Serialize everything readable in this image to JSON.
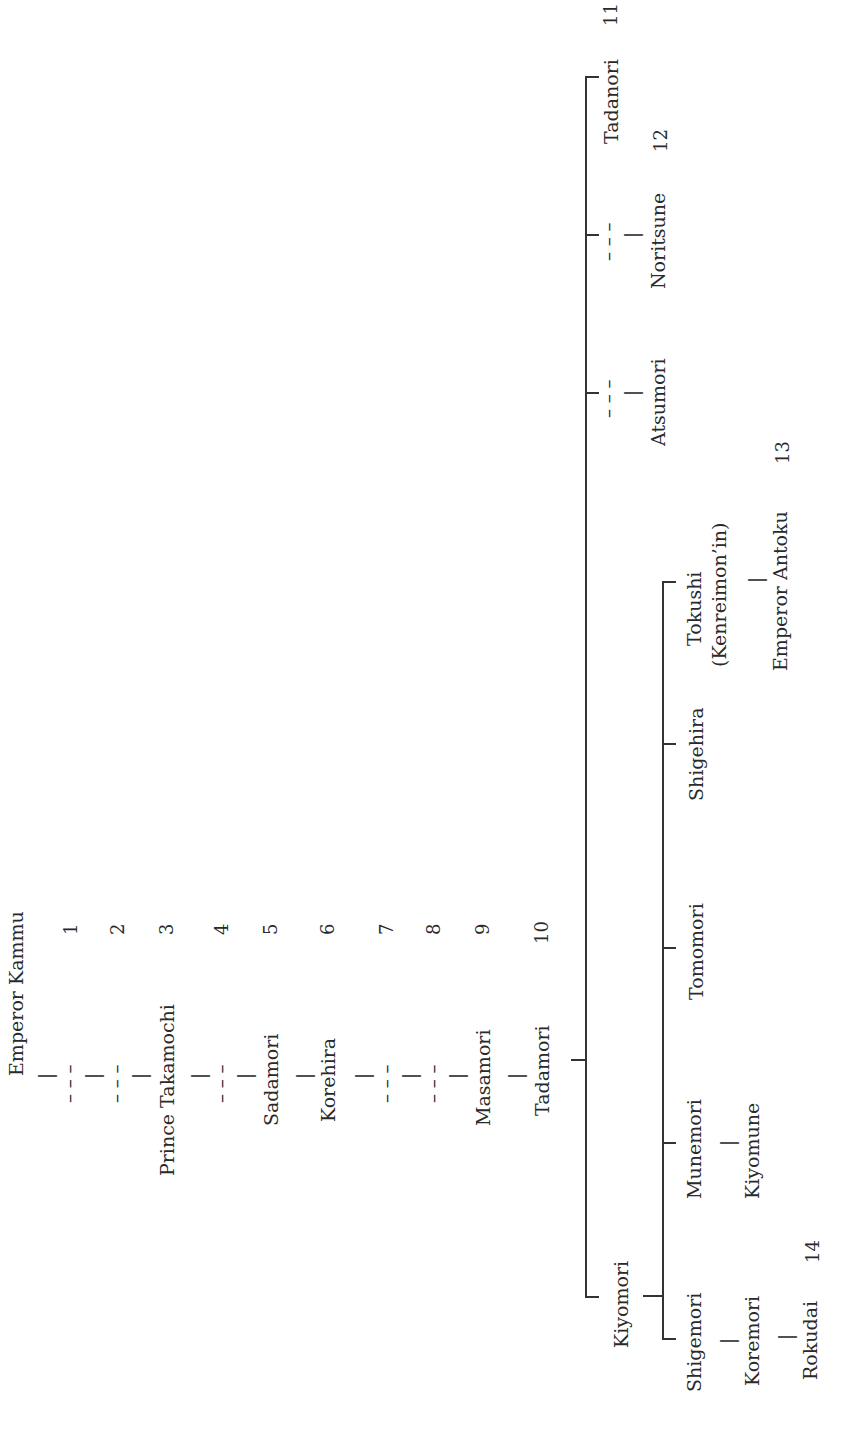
{
  "diagram": {
    "type": "genealogy",
    "orientation": "rotated-90-ccw",
    "line_color": "#333333",
    "text_color": "#2a2a2a",
    "ancestors": [
      {
        "name": "Emperor Kammu",
        "number": ""
      },
      {
        "name": "– – –",
        "number": "1"
      },
      {
        "name": "– – –",
        "number": "2"
      },
      {
        "name": "Prince Takamochi",
        "number": "3"
      },
      {
        "name": "– – –",
        "number": "4"
      },
      {
        "name": "Sadamori",
        "number": "5"
      },
      {
        "name": "Korehira",
        "number": "6"
      },
      {
        "name": "– – –",
        "number": "7"
      },
      {
        "name": "– – –",
        "number": "8"
      },
      {
        "name": "Masamori",
        "number": "9"
      },
      {
        "name": "Tadamori",
        "number": "10"
      }
    ],
    "tadamori_children": [
      {
        "name": "Kiyomori",
        "number": ""
      },
      {
        "name": "– – –",
        "child": "Atsumori",
        "number": ""
      },
      {
        "name": "– – –",
        "child": "Noritsune",
        "number": "12"
      },
      {
        "name": "Tadanori",
        "number": "11"
      }
    ],
    "kiyomori_children": [
      {
        "name": "Shigemori",
        "descendants": [
          "Koremori",
          "Rokudai"
        ],
        "number": "14"
      },
      {
        "name": "Munemori",
        "descendants": [
          "Kiyomune"
        ]
      },
      {
        "name": "Tomomori"
      },
      {
        "name": "Shigehira"
      },
      {
        "name": "Tokushi",
        "subtitle": "(Kenreimon’in)",
        "descendants": [
          "Emperor Antoku"
        ],
        "number": "13"
      }
    ],
    "connector_tick": "|",
    "dashed_gap": "– – –"
  },
  "labels": {
    "kammu": "Emperor Kammu",
    "takamochi": "Prince Takamochi",
    "sadamori": "Sadamori",
    "korehira": "Korehira",
    "masamori": "Masamori",
    "tadamori": "Tadamori",
    "kiyomori": "Kiyomori",
    "atsumori": "Atsumori",
    "noritsune": "Noritsune",
    "tadanori": "Tadanori",
    "shigemori": "Shigemori",
    "koremori": "Koremori",
    "rokudai": "Rokudai",
    "munemori": "Munemori",
    "kiyomune": "Kiyomune",
    "tomomori": "Tomomori",
    "shigehira": "Shigehira",
    "tokushi": "Tokushi",
    "kenreimon": "(Kenreimon’in)",
    "antoku": "Emperor Antoku",
    "tick": "|",
    "dash": "– – –",
    "n1": "1",
    "n2": "2",
    "n3": "3",
    "n4": "4",
    "n5": "5",
    "n6": "6",
    "n7": "7",
    "n8": "8",
    "n9": "9",
    "n10": "10",
    "n11": "11",
    "n12": "12",
    "n13": "13",
    "n14": "14"
  }
}
